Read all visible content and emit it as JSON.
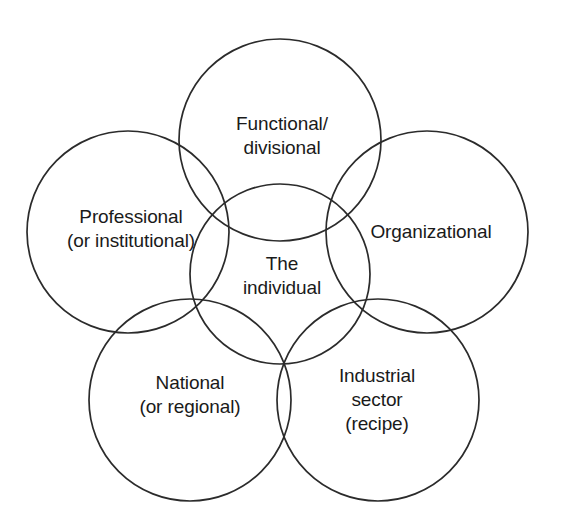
{
  "diagram": {
    "type": "venn-overlapping-circles",
    "title": "",
    "background_color": "#ffffff",
    "stroke_color": "#2b2b2b",
    "text_color": "#1a1a1a",
    "center": {
      "id": "the-individual",
      "lines": [
        "The",
        "individual"
      ],
      "cx": 280,
      "cy": 274,
      "r": 90,
      "label_x": 282,
      "label_y": 276
    },
    "petals": [
      {
        "id": "functional-divisional",
        "lines": [
          "Functional/",
          "divisional"
        ],
        "cx": 280,
        "cy": 140,
        "r": 101,
        "label_x": 282,
        "label_y": 136
      },
      {
        "id": "professional-institutional",
        "lines": [
          "Professional",
          "(or institutional)"
        ],
        "cx": 128,
        "cy": 232,
        "r": 101,
        "label_x": 131,
        "label_y": 229
      },
      {
        "id": "organizational",
        "lines": [
          "Organizational"
        ],
        "cx": 427,
        "cy": 232,
        "r": 101,
        "label_x": 431,
        "label_y": 232
      },
      {
        "id": "national-regional",
        "lines": [
          "National",
          "(or regional)"
        ],
        "cx": 190,
        "cy": 400,
        "r": 101,
        "label_x": 190,
        "label_y": 395
      },
      {
        "id": "industrial-sector-recipe",
        "lines": [
          "Industrial",
          "sector",
          "(recipe)"
        ],
        "cx": 378,
        "cy": 400,
        "r": 101,
        "label_x": 377,
        "label_y": 400
      }
    ]
  }
}
